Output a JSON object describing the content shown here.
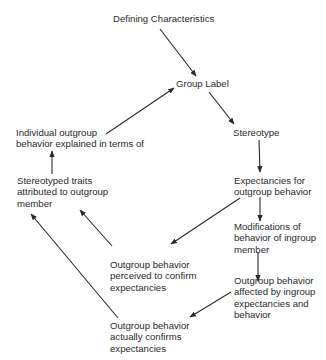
{
  "diagram": {
    "type": "flow-cycle",
    "nodes": {
      "defining": {
        "lines": [
          "Defining Characteristics"
        ]
      },
      "group_label": {
        "lines": [
          "Group Label"
        ]
      },
      "stereotype": {
        "lines": [
          "Stereotype"
        ]
      },
      "individual": {
        "lines": [
          "Individual outgroup",
          "behavior explained in terms of"
        ]
      },
      "traits": {
        "lines": [
          "Stereotyped traits",
          "attributed to outgroup",
          "member"
        ]
      },
      "expectancies": {
        "lines": [
          "Expectancies for",
          "outgroup behavior"
        ]
      },
      "modifications": {
        "lines": [
          "Modifications of",
          "behavior of ingroup",
          "member"
        ]
      },
      "perceived": {
        "lines": [
          "Outgroup behavior",
          "perceived to confirm",
          "expectancies"
        ]
      },
      "affected": {
        "lines": [
          "Outgroup behavior",
          "affected by ingroup",
          "expectancies and",
          "behavior"
        ]
      },
      "confirms": {
        "lines": [
          "Outgroup behavior",
          "actually confirms",
          "expectancies"
        ]
      }
    },
    "edges": [
      {
        "from": "defining",
        "to": "group_label"
      },
      {
        "from": "group_label",
        "to": "stereotype"
      },
      {
        "from": "individual",
        "to": "group_label"
      },
      {
        "from": "stereotype",
        "to": "expectancies"
      },
      {
        "from": "traits",
        "to": "individual"
      },
      {
        "from": "expectancies",
        "to": "modifications"
      },
      {
        "from": "expectancies",
        "to": "perceived"
      },
      {
        "from": "perceived",
        "to": "traits"
      },
      {
        "from": "modifications",
        "to": "affected"
      },
      {
        "from": "affected",
        "to": "confirms"
      },
      {
        "from": "confirms",
        "to": "traits"
      }
    ],
    "colors": {
      "line": "#2a2a2a",
      "text": "#2a2a2a",
      "background": "#ffffff"
    }
  }
}
